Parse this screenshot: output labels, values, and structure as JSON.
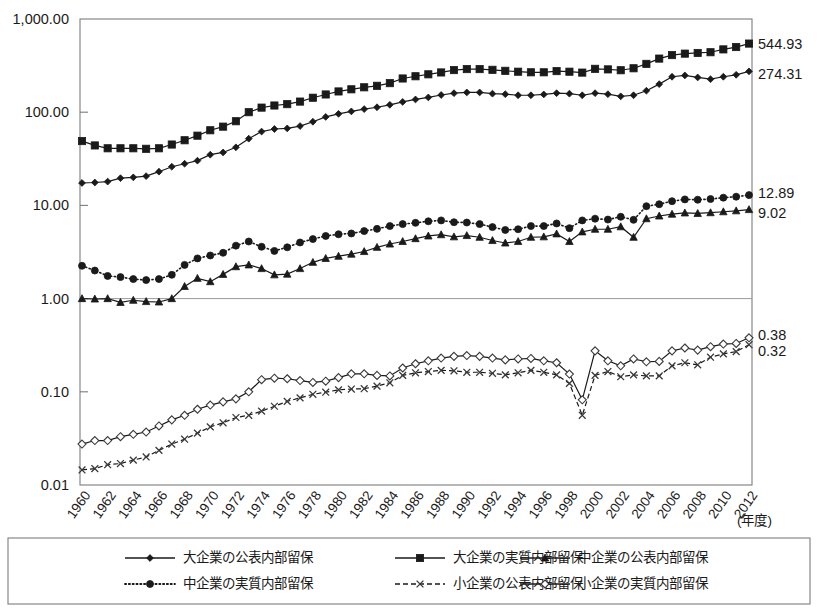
{
  "chart_data": {
    "type": "line",
    "title": "",
    "subtitle": "",
    "xlabel": "(年度)",
    "ylabel": "",
    "log_scale_y": true,
    "ylim": [
      0.01,
      1000
    ],
    "grid": false,
    "legend_position": "bottom",
    "y_ticks": [
      "1,000.00",
      "100.00",
      "10.00",
      "1.00",
      "0.10",
      "0.01"
    ],
    "y_tick_values": [
      1000,
      100,
      10,
      1,
      0.1,
      0.01
    ],
    "x_tick_labels": [
      "1960",
      "1962",
      "1964",
      "1966",
      "1968",
      "1970",
      "1972",
      "1974",
      "1976",
      "1978",
      "1980",
      "1982",
      "1984",
      "1986",
      "1988",
      "1990",
      "1992",
      "1994",
      "1996",
      "1998",
      "2000",
      "2002",
      "2004",
      "2006",
      "2008",
      "2010",
      "2012"
    ],
    "x_unit_label": "(年度)",
    "x": [
      1960,
      1961,
      1962,
      1963,
      1964,
      1965,
      1966,
      1967,
      1968,
      1969,
      1970,
      1971,
      1972,
      1973,
      1974,
      1975,
      1976,
      1977,
      1978,
      1979,
      1980,
      1981,
      1982,
      1983,
      1984,
      1985,
      1986,
      1987,
      1988,
      1989,
      1990,
      1991,
      1992,
      1993,
      1994,
      1995,
      1996,
      1997,
      1998,
      1999,
      2000,
      2001,
      2002,
      2003,
      2004,
      2005,
      2006,
      2007,
      2008,
      2009,
      2010,
      2011,
      2012
    ],
    "series": [
      {
        "name": "大企業の公表内部留保",
        "marker": "diamond-filled",
        "line_style": "solid",
        "end_value": "274.31",
        "values": [
          17.4,
          17.6,
          18.0,
          19.6,
          20.0,
          20.6,
          23.0,
          26.0,
          28.0,
          30.2,
          35.0,
          37.0,
          42.0,
          52.0,
          62.0,
          66.0,
          67.0,
          71.0,
          79.0,
          89.0,
          96.0,
          102.0,
          108.0,
          113.0,
          120.0,
          129.0,
          137.0,
          144.0,
          153.0,
          160.0,
          163.0,
          163.0,
          158.0,
          156.0,
          152.0,
          152.0,
          155.0,
          160.0,
          158.0,
          152.0,
          160.0,
          156.0,
          148.0,
          152.0,
          170.0,
          200.0,
          240.0,
          248.0,
          236.0,
          226.0,
          240.0,
          252.0,
          274.31
        ]
      },
      {
        "name": "大企業の実質内部留保",
        "marker": "square-filled",
        "line_style": "solid",
        "end_value": "544.93",
        "values": [
          49.0,
          44.0,
          41.0,
          41.0,
          41.0,
          40.5,
          41.0,
          45.0,
          50.0,
          56.0,
          64.0,
          70.0,
          80.0,
          100.0,
          112.0,
          118.0,
          122.0,
          130.0,
          143.0,
          155.0,
          167.0,
          176.0,
          185.0,
          192.0,
          205.0,
          230.0,
          243.0,
          255.0,
          267.0,
          283.0,
          290.0,
          290.0,
          285.0,
          278.0,
          272.0,
          268.0,
          268.0,
          276.0,
          272.0,
          266.0,
          292.0,
          288.0,
          282.0,
          296.0,
          330.0,
          376.0,
          410.0,
          425.0,
          432.0,
          440.0,
          472.0,
          500.0,
          544.93
        ]
      },
      {
        "name": "中企業の公表内部留保",
        "marker": "triangle-filled",
        "line_style": "solid",
        "end_value": "9.02",
        "values": [
          1.0,
          0.99,
          1.0,
          0.91,
          0.96,
          0.93,
          0.92,
          1.0,
          1.35,
          1.65,
          1.52,
          1.82,
          2.2,
          2.3,
          2.1,
          1.8,
          1.83,
          2.1,
          2.45,
          2.7,
          2.85,
          3.0,
          3.2,
          3.55,
          3.85,
          4.1,
          4.4,
          4.7,
          4.85,
          4.6,
          4.75,
          4.55,
          4.2,
          3.95,
          4.1,
          4.55,
          4.6,
          4.95,
          4.1,
          5.2,
          5.55,
          5.55,
          5.9,
          4.55,
          7.2,
          7.7,
          8.05,
          8.3,
          8.2,
          8.35,
          8.55,
          8.75,
          9.02
        ]
      },
      {
        "name": "中企業の実質内部留保",
        "marker": "circle-filled",
        "line_style": "dotted",
        "end_value": "12.89",
        "values": [
          2.25,
          2.0,
          1.75,
          1.7,
          1.62,
          1.58,
          1.62,
          1.8,
          2.3,
          2.7,
          2.9,
          3.1,
          3.7,
          4.1,
          3.6,
          3.25,
          3.55,
          4.0,
          4.35,
          4.7,
          4.9,
          5.0,
          5.3,
          5.6,
          6.0,
          6.3,
          6.5,
          6.75,
          6.9,
          6.6,
          6.55,
          6.3,
          5.85,
          5.45,
          5.55,
          6.0,
          6.0,
          6.4,
          5.7,
          6.9,
          7.2,
          7.05,
          7.55,
          7.0,
          9.8,
          10.3,
          11.1,
          11.6,
          11.5,
          11.7,
          12.1,
          12.4,
          12.89
        ]
      },
      {
        "name": "小企業の公表内部留保",
        "marker": "x",
        "line_style": "dashed",
        "end_value": "0.32",
        "values": [
          0.0145,
          0.015,
          0.0165,
          0.017,
          0.0185,
          0.02,
          0.0235,
          0.0275,
          0.031,
          0.036,
          0.042,
          0.0465,
          0.053,
          0.056,
          0.062,
          0.07,
          0.079,
          0.086,
          0.094,
          0.099,
          0.105,
          0.107,
          0.108,
          0.115,
          0.125,
          0.15,
          0.16,
          0.165,
          0.17,
          0.168,
          0.162,
          0.162,
          0.158,
          0.152,
          0.16,
          0.17,
          0.162,
          0.152,
          0.123,
          0.056,
          0.15,
          0.165,
          0.145,
          0.152,
          0.148,
          0.148,
          0.19,
          0.205,
          0.195,
          0.235,
          0.255,
          0.27,
          0.32
        ]
      },
      {
        "name": "小企業の実質内部留保",
        "marker": "diamond-open",
        "line_style": "solid",
        "end_value": "0.38",
        "values": [
          0.0275,
          0.03,
          0.03,
          0.033,
          0.035,
          0.037,
          0.043,
          0.05,
          0.056,
          0.065,
          0.072,
          0.078,
          0.084,
          0.1,
          0.135,
          0.14,
          0.138,
          0.132,
          0.126,
          0.13,
          0.142,
          0.156,
          0.156,
          0.15,
          0.148,
          0.18,
          0.2,
          0.215,
          0.23,
          0.24,
          0.245,
          0.24,
          0.23,
          0.22,
          0.225,
          0.228,
          0.215,
          0.205,
          0.155,
          0.082,
          0.275,
          0.215,
          0.19,
          0.225,
          0.21,
          0.212,
          0.275,
          0.295,
          0.28,
          0.305,
          0.325,
          0.33,
          0.38
        ]
      }
    ],
    "end_labels": [
      {
        "value": "544.93",
        "series": "大企業の実質内部留保",
        "marker": "square-filled"
      },
      {
        "value": "274.31",
        "series": "大企業の公表内部留保",
        "marker": "diamond-filled"
      },
      {
        "value": "12.89",
        "series": "中企業の実質内部留保",
        "marker": "circle-filled"
      },
      {
        "value": "9.02",
        "series": "中企業の公表内部留保",
        "marker": "triangle-filled"
      },
      {
        "value": "0.38",
        "series": "小企業の実質内部留保",
        "marker": "diamond-open"
      },
      {
        "value": "0.32",
        "series": "小企業の公表内部留保",
        "marker": "x"
      }
    ],
    "legend": [
      {
        "label": "大企業の公表内部留保",
        "marker": "diamond-filled",
        "line_style": "solid"
      },
      {
        "label": "大企業の実質内部留保",
        "marker": "square-filled",
        "line_style": "solid"
      },
      {
        "label": "中企業の公表内部留保",
        "marker": "triangle-filled",
        "line_style": "solid"
      },
      {
        "label": "中企業の実質内部留保",
        "marker": "circle-filled",
        "line_style": "dotted"
      },
      {
        "label": "小企業の公表内部留保",
        "marker": "x",
        "line_style": "dashed"
      },
      {
        "label": "小企業の実質内部留保",
        "marker": "diamond-open",
        "line_style": "solid"
      }
    ],
    "colors": {
      "ink": "#1a1a1a",
      "frame": "#7d7d7d",
      "grid": "#9a9a9a",
      "background": "#ffffff"
    }
  }
}
